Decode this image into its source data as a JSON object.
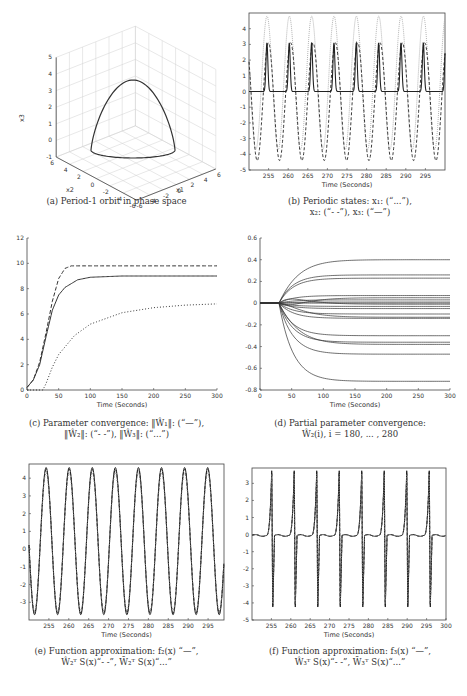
{
  "figure": {
    "panels": [
      {
        "id": "a",
        "caption_lines": [
          "(a) Period-1 orbit in phase space"
        ]
      },
      {
        "id": "b",
        "caption_lines": [
          "(b) Periodic states: x₁: (“...”),",
          "x₂: (“- -”), x₃: (“—”)"
        ]
      },
      {
        "id": "c",
        "caption_lines": [
          "(c) Parameter convergence: ‖Ŵ₁‖: (“—”),",
          "‖Ŵ₂‖: (“- -”), ‖Ŵ₃‖: (“...”)"
        ]
      },
      {
        "id": "d",
        "caption_lines": [
          "(d) Partial parameter convergence:",
          "Ŵ₂(i), i = 180, ... , 280"
        ]
      },
      {
        "id": "e",
        "caption_lines": [
          "(e) Function approximation: f₂(x) “—”,",
          "Ŵ₂ᵀ S(x)“- -”, W̄₂ᵀ S(x)“...”"
        ]
      },
      {
        "id": "f",
        "caption_lines": [
          "(f) Function approximation: f₃(x) “—”,",
          "Ŵ₃ᵀ S(x)“- -”, W̄₃ᵀ S(x)“...”"
        ]
      }
    ]
  },
  "chart_data": [
    {
      "id": "a",
      "type": "line3d",
      "title": "Period-1 orbit in phase space",
      "xlabel": "x1",
      "ylabel": "x2",
      "zlabel": "x3",
      "xlim": [
        -6,
        6
      ],
      "ylim": [
        -6,
        6
      ],
      "zlim": [
        -1,
        5
      ],
      "x_ticks": [
        -6,
        -4,
        -2,
        0,
        2,
        4,
        6
      ],
      "y_ticks": [
        6,
        4,
        2,
        0,
        -2,
        -4,
        -6
      ],
      "z_ticks": [
        -1,
        0,
        1,
        2,
        3,
        4,
        5
      ],
      "grid": true,
      "series": [
        {
          "name": "orbit",
          "description": "closed loop, peak x3 ≈ 3.5, base x3 ≈ 0"
        }
      ]
    },
    {
      "id": "b",
      "type": "line",
      "title": "Periodic states",
      "xlabel": "Time (Seconds)",
      "ylabel": "",
      "xlim": [
        250,
        300
      ],
      "ylim": [
        -5,
        5
      ],
      "x_ticks": [
        255,
        260,
        265,
        270,
        275,
        280,
        285,
        290,
        295
      ],
      "y_ticks": [
        -5,
        -4,
        -3,
        -2,
        -1,
        0,
        1,
        2,
        3,
        4
      ],
      "period": 5.7,
      "series": [
        {
          "name": "x1",
          "style": "dotted",
          "color": "#aaaaaa",
          "max": 4.8,
          "min": -3.7
        },
        {
          "name": "x2",
          "style": "dashed",
          "color": "#222222",
          "max": 3.1,
          "min": -4.4
        },
        {
          "name": "x3",
          "style": "solid",
          "color": "#222222",
          "max": 3.1,
          "min": 0.0
        }
      ]
    },
    {
      "id": "c",
      "type": "line",
      "title": "Parameter convergence",
      "xlabel": "Time (Seconds)",
      "ylabel": "",
      "xlim": [
        0,
        300
      ],
      "ylim": [
        0,
        12
      ],
      "x_ticks": [
        0,
        50,
        100,
        150,
        200,
        250,
        300
      ],
      "y_ticks": [
        0,
        2,
        4,
        6,
        8,
        10,
        12
      ],
      "series": [
        {
          "name": "||W1||",
          "style": "solid",
          "x": [
            0,
            10,
            20,
            30,
            40,
            50,
            60,
            80,
            100,
            150,
            200,
            300
          ],
          "values": [
            0.2,
            0.8,
            2,
            4.2,
            6.3,
            7.5,
            8.1,
            8.7,
            8.9,
            9.0,
            9.0,
            9.0
          ]
        },
        {
          "name": "||W2||",
          "style": "dashed",
          "x": [
            0,
            10,
            20,
            30,
            40,
            50,
            60,
            70,
            300
          ],
          "values": [
            0.2,
            0.8,
            2.2,
            4.5,
            7,
            8.8,
            9.6,
            9.8,
            9.8
          ]
        },
        {
          "name": "||W3||",
          "style": "dotted",
          "x": [
            0,
            20,
            25,
            30,
            40,
            50,
            75,
            100,
            150,
            200,
            250,
            300
          ],
          "values": [
            0,
            0,
            0,
            0.5,
            1.8,
            2.8,
            4.3,
            5.2,
            6.1,
            6.5,
            6.7,
            6.8
          ]
        }
      ]
    },
    {
      "id": "d",
      "type": "line",
      "title": "Partial parameter convergence",
      "xlabel": "Time (Seconds)",
      "ylabel": "",
      "xlim": [
        0,
        300
      ],
      "ylim": [
        -0.8,
        0.6
      ],
      "x_ticks": [
        0,
        50,
        100,
        150,
        200,
        250,
        300
      ],
      "y_ticks": [
        -0.8,
        -0.6,
        -0.4,
        -0.2,
        0,
        0.2,
        0.4,
        0.6
      ],
      "final_values": [
        0.4,
        0.26,
        0.23,
        0.07,
        0.05,
        0.03,
        0.01,
        0.0,
        -0.01,
        -0.03,
        -0.05,
        -0.1,
        -0.13,
        -0.14,
        -0.3,
        -0.36,
        -0.38,
        -0.47,
        -0.72
      ],
      "start_time": 30
    },
    {
      "id": "e",
      "type": "line",
      "title": "Function approximation f2",
      "xlabel": "Time (Seconds)",
      "ylabel": "",
      "xlim": [
        250,
        299
      ],
      "ylim": [
        -4,
        4.8
      ],
      "x_ticks": [
        255,
        260,
        265,
        270,
        275,
        280,
        285,
        290,
        295
      ],
      "y_ticks": [
        -3,
        -2,
        -1,
        0,
        1,
        2,
        3,
        4
      ],
      "period": 5.8,
      "series": [
        {
          "name": "f2(x)",
          "style": "solid",
          "max": 4.6,
          "min": -3.7
        },
        {
          "name": "W2hat^T S(x)",
          "style": "dashed",
          "max": 4.5,
          "min": -3.6
        },
        {
          "name": "W2bar^T S(x)",
          "style": "dotted",
          "max": 4.3,
          "min": -3.5
        }
      ]
    },
    {
      "id": "f",
      "type": "line",
      "title": "Function approximation f3",
      "xlabel": "Time (Seconds)",
      "ylabel": "",
      "xlim": [
        250,
        300
      ],
      "ylim": [
        -5,
        3.9
      ],
      "x_ticks": [
        255,
        260,
        265,
        270,
        275,
        280,
        285,
        290,
        295,
        300
      ],
      "y_ticks": [
        -5,
        -4,
        -3,
        -2,
        -1,
        0,
        1,
        2,
        3
      ],
      "period": 5.8,
      "series": [
        {
          "name": "f3(x)",
          "style": "solid",
          "max": 3.9,
          "min": -4.4
        },
        {
          "name": "W3hat^T S(x)",
          "style": "dashed",
          "max": 3.8,
          "min": -4.3
        },
        {
          "name": "W3bar^T S(x)",
          "style": "dotted",
          "max": 3.7,
          "min": -4.2
        }
      ]
    }
  ]
}
